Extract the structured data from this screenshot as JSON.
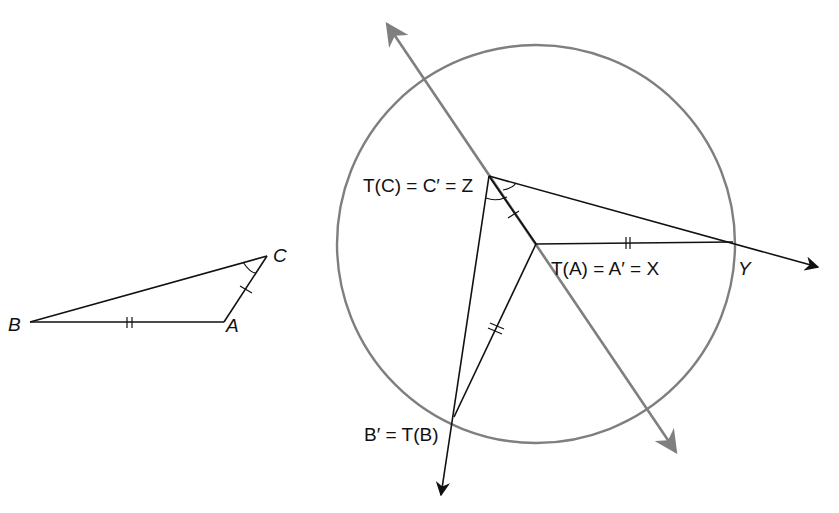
{
  "diagram": {
    "type": "geometric-transformation",
    "colors": {
      "ink": "#111111",
      "gray": "#7f7f7f",
      "background": "#ffffff"
    },
    "original_triangle": {
      "vertices": {
        "B": {
          "label": "B",
          "x": 30,
          "y": 322
        },
        "A": {
          "label": "A",
          "x": 224,
          "y": 322
        },
        "C": {
          "label": "C",
          "x": 267,
          "y": 256
        }
      },
      "marks": {
        "BA": "double-tick",
        "AC": "single-tick",
        "angle_C": "arc"
      }
    },
    "image_figure": {
      "labels": {
        "Z": "T(C) = C′ = Z",
        "X": "T(A) = A′ = X",
        "Y": "Y",
        "B": "B′ = T(B)"
      },
      "points": {
        "Z": {
          "x": 489,
          "y": 176
        },
        "X": {
          "x": 536,
          "y": 244
        },
        "Y": {
          "x": 733,
          "y": 242
        },
        "Bp": {
          "x": 454,
          "y": 417
        }
      },
      "circle": {
        "cx": 536,
        "cy": 244,
        "r": 199,
        "color": "gray",
        "note": "centered at X"
      },
      "rays": [
        {
          "name": "ray-XY",
          "from": "X",
          "to_arrow": {
            "x": 818,
            "y": 267
          },
          "via": "Z",
          "color": "ink"
        },
        {
          "name": "ray-ZB",
          "from": "Z",
          "to_arrow": {
            "x": 441,
            "y": 495
          },
          "color": "ink"
        },
        {
          "name": "line-ZX-gray",
          "arrow1": {
            "x": 387,
            "y": 24
          },
          "arrow2": {
            "x": 676,
            "y": 452
          },
          "color": "gray"
        }
      ],
      "marks": {
        "XY": "double-tick",
        "XBp": "double-tick",
        "ZX": "single-tick",
        "angle_Z": "arc"
      }
    }
  }
}
